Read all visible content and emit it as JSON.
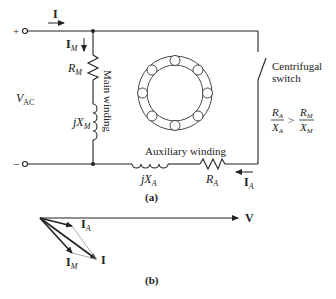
{
  "figure_a": {
    "caption": "(a)",
    "source_label": "V",
    "source_label_sub": "AC",
    "terminal_plus": "+",
    "terminal_minus": "−",
    "line_current": "I",
    "main_current": "I",
    "main_current_sub": "M",
    "main_resistor": "R",
    "main_resistor_sub": "M",
    "main_reactance_prefix": "jX",
    "main_reactance_sub": "M",
    "main_winding_label": "Main winding",
    "aux_winding_label": "Auxiliary winding",
    "aux_reactance_prefix": "jX",
    "aux_reactance_sub": "A",
    "aux_resistor": "R",
    "aux_resistor_sub": "A",
    "aux_current": "I",
    "aux_current_sub": "A",
    "switch_label_line1": "Centrifugal",
    "switch_label_line2": "switch",
    "condition": {
      "left_num": "R",
      "left_num_sub": "A",
      "left_den": "X",
      "left_den_sub": "A",
      "operator": ">",
      "right_num": "R",
      "right_num_sub": "M",
      "right_den": "X",
      "right_den_sub": "M"
    }
  },
  "figure_b": {
    "caption": "(b)",
    "voltage_label": "V",
    "aux_current": "I",
    "aux_current_sub": "A",
    "main_current": "I",
    "main_current_sub": "M",
    "total_current": "I"
  },
  "colors": {
    "line": "#222222",
    "background": "#ffffff"
  }
}
